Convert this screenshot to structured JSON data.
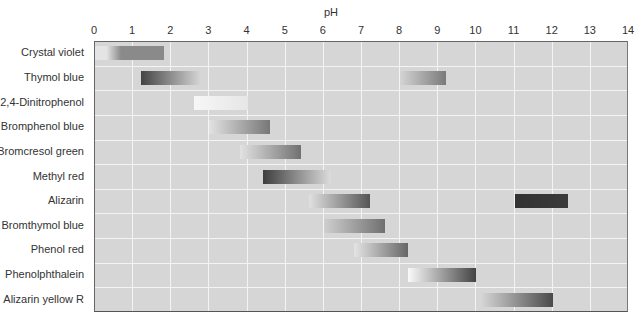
{
  "chart_data": {
    "type": "bar",
    "orientation": "horizontal-range",
    "title": "",
    "xlabel": "pH",
    "ylabel": "",
    "xlim": [
      0,
      14
    ],
    "x_ticks": [
      0,
      1,
      2,
      3,
      4,
      5,
      6,
      7,
      8,
      9,
      10,
      11,
      12,
      13,
      14
    ],
    "grid": true,
    "legend": null,
    "categories": [
      "Crystal violet",
      "Thymol blue",
      "2,4-Dinitrophenol",
      "Bromphenol blue",
      "Bromcresol green",
      "Methyl red",
      "Alizarin",
      "Bromthymol blue",
      "Phenol red",
      "Phenolphthalein",
      "Alizarin yellow R"
    ],
    "ranges": [
      {
        "indicator": "Crystal violet",
        "row": 0,
        "start": 0.0,
        "end": 1.8,
        "from_color": "#e4e4e4",
        "to_color": "#8a8a8a",
        "light_until": 0.5
      },
      {
        "indicator": "Thymol blue",
        "row": 1,
        "start": 1.2,
        "end": 2.8,
        "from_color": "#444444",
        "to_color": "#d9d9d9"
      },
      {
        "indicator": "Thymol blue",
        "row": 1,
        "start": 8.0,
        "end": 9.2,
        "from_color": "#d4d4d4",
        "to_color": "#7a7a7a"
      },
      {
        "indicator": "2,4-Dinitrophenol",
        "row": 2,
        "start": 2.6,
        "end": 4.0,
        "from_color": "#f7f7f7",
        "to_color": "#e6e6e6"
      },
      {
        "indicator": "Bromphenol blue",
        "row": 3,
        "start": 3.0,
        "end": 4.6,
        "from_color": "#e2e2e2",
        "to_color": "#777777"
      },
      {
        "indicator": "Bromcresol green",
        "row": 4,
        "start": 3.8,
        "end": 5.4,
        "from_color": "#e2e2e2",
        "to_color": "#717171"
      },
      {
        "indicator": "Methyl red",
        "row": 5,
        "start": 4.4,
        "end": 6.2,
        "from_color": "#3e3e3e",
        "to_color": "#dcdcdc"
      },
      {
        "indicator": "Alizarin",
        "row": 6,
        "start": 5.6,
        "end": 7.2,
        "from_color": "#e0e0e0",
        "to_color": "#555555"
      },
      {
        "indicator": "Alizarin",
        "row": 6,
        "start": 11.0,
        "end": 12.4,
        "from_color": "#333333",
        "to_color": "#3a3a3a"
      },
      {
        "indicator": "Bromthymol blue",
        "row": 7,
        "start": 6.0,
        "end": 7.6,
        "from_color": "#cfcfcf",
        "to_color": "#707070"
      },
      {
        "indicator": "Phenol red",
        "row": 8,
        "start": 6.8,
        "end": 8.2,
        "from_color": "#e4e4e4",
        "to_color": "#666666"
      },
      {
        "indicator": "Phenolphthalein",
        "row": 9,
        "start": 8.2,
        "end": 10.0,
        "from_color": "#fafafa",
        "to_color": "#444444"
      },
      {
        "indicator": "Alizarin yellow R",
        "row": 10,
        "start": 10.1,
        "end": 12.0,
        "from_color": "#d8d8d8",
        "to_color": "#4a4a4a"
      }
    ]
  },
  "colors": {
    "plot_background": "#d6d6d6",
    "grid": "#f4f4f4",
    "axis": "#666666"
  }
}
